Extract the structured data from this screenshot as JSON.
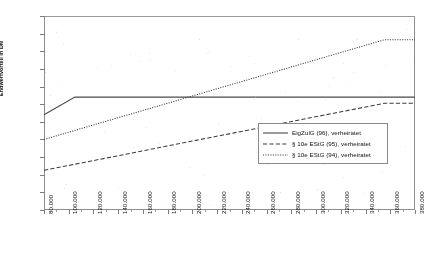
{
  "chart_data": {
    "type": "line",
    "title": "",
    "xlabel": "",
    "ylabel": "Endwertvorteil in DM",
    "xlim": [
      80000,
      380000
    ],
    "ylim": [
      0,
      110000
    ],
    "grid": false,
    "legend_position": "inside-right",
    "xticks": [
      "80.000",
      "100.000",
      "120.000",
      "140.000",
      "160.000",
      "180.000",
      "200.000",
      "220.000",
      "240.000",
      "260.000",
      "280.000",
      "300.000",
      "320.000",
      "340.000",
      "360.000",
      "380.000"
    ],
    "yticks": [
      "0",
      "10.000",
      "20.000",
      "30.000",
      "40.000",
      "50.000",
      "60.000",
      "70.000",
      "80.000",
      "90.000",
      "100.000",
      "110.000"
    ],
    "series": [
      {
        "name": "EigZulG (96), verheiratet",
        "style": "solid",
        "x": [
          80000,
          105000,
          380000
        ],
        "values": [
          54000,
          64000,
          64000
        ]
      },
      {
        "name": "§ 10e EStG (95), verheiratet",
        "style": "dashed",
        "x": [
          80000,
          355000,
          380000
        ],
        "values": [
          22500,
          60500,
          60500
        ]
      },
      {
        "name": "§ 10e EStG (94), verheiratet",
        "style": "dotted",
        "x": [
          80000,
          355000,
          380000
        ],
        "values": [
          40000,
          96500,
          96500
        ]
      }
    ]
  },
  "axes": {
    "y_title": "Endwertvorteil in DM"
  },
  "legend": {
    "items": [
      {
        "label": "EigZulG (96), verheiratet",
        "style": "solid"
      },
      {
        "label": "§ 10e EStG (95), verheiratet",
        "style": "dashed"
      },
      {
        "label": "§ 10e EStG (94), verheiratet",
        "style": "dotted"
      }
    ]
  }
}
